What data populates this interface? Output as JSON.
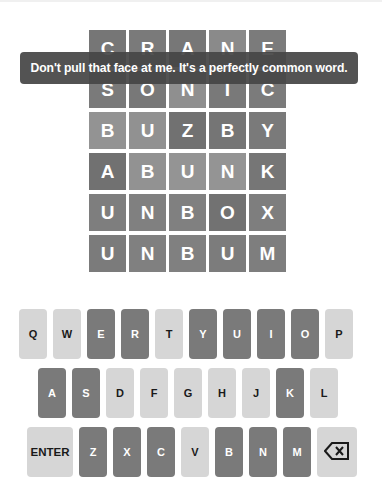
{
  "toast": {
    "message": "Don't pull that face at me. It's a perfectly common word."
  },
  "board": {
    "rows": [
      {
        "letters": [
          "C",
          "R",
          "A",
          "N",
          "E"
        ],
        "colors": [
          "#767676",
          "#7a7a7a",
          "#777777",
          "#8a8a8a",
          "#7b7b7b"
        ]
      },
      {
        "letters": [
          "S",
          "O",
          "N",
          "I",
          "C"
        ],
        "colors": [
          "#7a7a7a",
          "#787878",
          "#8f8f8f",
          "#797979",
          "#7b7b7b"
        ]
      },
      {
        "letters": [
          "B",
          "U",
          "Z",
          "B",
          "Y"
        ],
        "colors": [
          "#939393",
          "#919191",
          "#717171",
          "#757575",
          "#7a7a7a"
        ]
      },
      {
        "letters": [
          "A",
          "B",
          "U",
          "N",
          "K"
        ],
        "colors": [
          "#717171",
          "#929292",
          "#949494",
          "#949494",
          "#767676"
        ]
      },
      {
        "letters": [
          "U",
          "N",
          "B",
          "O",
          "X"
        ],
        "colors": [
          "#7e7e7e",
          "#808080",
          "#808080",
          "#727272",
          "#7e7e7e"
        ]
      },
      {
        "letters": [
          "U",
          "N",
          "B",
          "U",
          "M"
        ],
        "colors": [
          "#7b7b7b",
          "#808080",
          "#808080",
          "#7c7c7c",
          "#7e7e7e"
        ]
      }
    ]
  },
  "keyboard": {
    "colors": {
      "unused": "#d6d6d6",
      "used": "#7a7a7a"
    },
    "rows": [
      [
        {
          "label": "Q",
          "state": "unused"
        },
        {
          "label": "W",
          "state": "unused"
        },
        {
          "label": "E",
          "state": "used"
        },
        {
          "label": "R",
          "state": "used"
        },
        {
          "label": "T",
          "state": "unused"
        },
        {
          "label": "Y",
          "state": "used"
        },
        {
          "label": "U",
          "state": "used"
        },
        {
          "label": "I",
          "state": "used"
        },
        {
          "label": "O",
          "state": "used"
        },
        {
          "label": "P",
          "state": "unused"
        }
      ],
      [
        {
          "label": "A",
          "state": "used"
        },
        {
          "label": "S",
          "state": "used"
        },
        {
          "label": "D",
          "state": "unused"
        },
        {
          "label": "F",
          "state": "unused"
        },
        {
          "label": "G",
          "state": "unused"
        },
        {
          "label": "H",
          "state": "unused"
        },
        {
          "label": "J",
          "state": "unused"
        },
        {
          "label": "K",
          "state": "used"
        },
        {
          "label": "L",
          "state": "unused"
        }
      ],
      [
        {
          "label": "ENTER",
          "state": "unused",
          "type": "enter"
        },
        {
          "label": "Z",
          "state": "used"
        },
        {
          "label": "X",
          "state": "used"
        },
        {
          "label": "C",
          "state": "used"
        },
        {
          "label": "V",
          "state": "unused"
        },
        {
          "label": "B",
          "state": "used"
        },
        {
          "label": "N",
          "state": "used"
        },
        {
          "label": "M",
          "state": "used"
        },
        {
          "label": "",
          "state": "unused",
          "type": "backspace",
          "icon": "backspace-icon"
        }
      ]
    ]
  }
}
